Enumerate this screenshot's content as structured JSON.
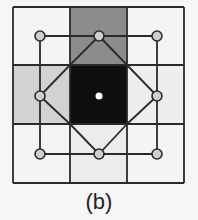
{
  "figure": {
    "caption": "(b)",
    "grid": {
      "x_lines": [
        13,
        70,
        127,
        184
      ],
      "y_lines": [
        7,
        65,
        124,
        183
      ],
      "line_color": "#2a2a2a"
    },
    "cells": [
      {
        "row": 0,
        "col": 0,
        "fill": "#f4f4f4"
      },
      {
        "row": 0,
        "col": 1,
        "fill": "#8c8c8c"
      },
      {
        "row": 0,
        "col": 2,
        "fill": "#f4f4f4"
      },
      {
        "row": 1,
        "col": 0,
        "fill": "#d2d2d2"
      },
      {
        "row": 1,
        "col": 1,
        "fill": "#0e0e0e"
      },
      {
        "row": 1,
        "col": 2,
        "fill": "#eeeeee"
      },
      {
        "row": 2,
        "col": 0,
        "fill": "#f4f4f4"
      },
      {
        "row": 2,
        "col": 1,
        "fill": "#ececec"
      },
      {
        "row": 2,
        "col": 2,
        "fill": "#f4f4f4"
      }
    ],
    "nodes": [
      {
        "x": 40,
        "y": 36
      },
      {
        "x": 99,
        "y": 36
      },
      {
        "x": 157,
        "y": 36
      },
      {
        "x": 40,
        "y": 96
      },
      {
        "x": 157,
        "y": 96
      },
      {
        "x": 40,
        "y": 154
      },
      {
        "x": 99,
        "y": 154
      },
      {
        "x": 157,
        "y": 154
      }
    ],
    "center_node": {
      "x": 99,
      "y": 96,
      "fill": "#ffffff"
    },
    "node_fill": "#cfcfcf",
    "node_stroke": "#2a2a2a"
  }
}
